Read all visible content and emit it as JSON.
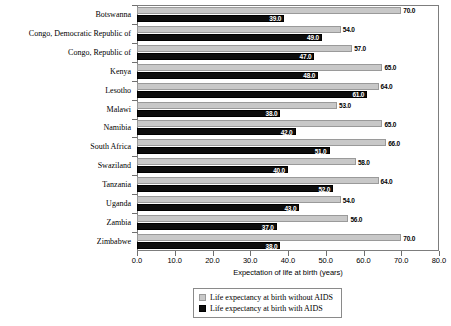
{
  "chart_data": {
    "type": "bar",
    "orientation": "horizontal",
    "title": "",
    "xlabel": "Expectation of life at birth (years)",
    "ylabel": "",
    "xlim": [
      0,
      80
    ],
    "xticks": [
      "0.0",
      "10.0",
      "20.0",
      "30.0",
      "40.0",
      "50.0",
      "60.0",
      "70.0",
      "80.0"
    ],
    "grid": false,
    "legend_position": "bottom-center",
    "categories": [
      "Botswanna",
      "Congo, Democratic Republic of",
      "Congo, Republic of",
      "Kenya",
      "Lesotho",
      "Malawi",
      "Namibia",
      "South Africa",
      "Swaziland",
      "Tanzania",
      "Uganda",
      "Zambia",
      "Zimbabwe"
    ],
    "series": [
      {
        "name": "Life expectancy at birth without AIDS",
        "color": "#c8c8c8",
        "values": [
          70.0,
          54.0,
          57.0,
          65.0,
          64.0,
          53.0,
          65.0,
          66.0,
          58.0,
          64.0,
          54.0,
          56.0,
          70.0
        ],
        "labels": [
          "70.0",
          "54.0",
          "57.0",
          "65.0",
          "64.0",
          "53.0",
          "65.0",
          "66.0",
          "58.0",
          "64.0",
          "54.0",
          "56.0",
          "70.0"
        ]
      },
      {
        "name": "Life expectancy at birth with AIDS",
        "color": "#0d0d0d",
        "values": [
          39.0,
          49.0,
          47.0,
          48.0,
          61.0,
          38.0,
          42.0,
          51.0,
          40.0,
          52.0,
          43.0,
          37.0,
          38.0
        ],
        "labels": [
          "39.0",
          "49.0",
          "47.0",
          "48.0",
          "61.0",
          "38.0",
          "42.0",
          "51.0",
          "40.0",
          "52.0",
          "43.0",
          "37.0",
          "38.0"
        ]
      }
    ]
  },
  "legend": {
    "items": [
      {
        "label": "Life expectancy at birth without AIDS",
        "swatch": "light"
      },
      {
        "label": "Life expectancy at birth with AIDS",
        "swatch": "dark"
      }
    ]
  }
}
